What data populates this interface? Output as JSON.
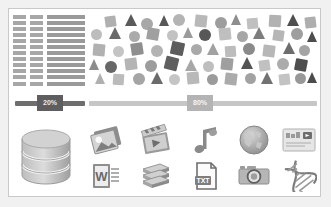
{
  "card": {
    "background": "#ffffff",
    "border_color": "#c9c9c9",
    "page_background": "#f1f1f1"
  },
  "list_block": {
    "name": "data-table-placeholder",
    "row_count": 12,
    "bar_color": "#9a9a9a",
    "cell_color": "#a7a7a7"
  },
  "shapes": {
    "name": "shape-scatter-cloud",
    "palette": [
      "#b9b9b9",
      "#a3a3a3",
      "#8c8c8c",
      "#6f6f6f",
      "#565656",
      "#cccccc"
    ],
    "items": [
      {
        "type": "square",
        "x": 18,
        "y": 5,
        "size": 11,
        "color": "#b0b0b0",
        "rot": -8
      },
      {
        "type": "triangle",
        "x": 38,
        "y": 3,
        "size": 12,
        "color": "#5a5a5a",
        "rot": 0
      },
      {
        "type": "circle",
        "x": 54,
        "y": 7,
        "size": 12,
        "color": "#a8a8a8"
      },
      {
        "type": "triangle",
        "x": 72,
        "y": 4,
        "size": 11,
        "color": "#585858",
        "rot": 0
      },
      {
        "type": "circle",
        "x": 86,
        "y": 3,
        "size": 12,
        "color": "#b4b4b4"
      },
      {
        "type": "square",
        "x": 108,
        "y": 4,
        "size": 12,
        "color": "#b8b8b8",
        "rot": 6
      },
      {
        "type": "circle",
        "x": 128,
        "y": 6,
        "size": 12,
        "color": "#9d9d9d"
      },
      {
        "type": "triangle",
        "x": 144,
        "y": 3,
        "size": 11,
        "color": "#8e8e8e",
        "rot": 0
      },
      {
        "type": "square",
        "x": 160,
        "y": 7,
        "size": 11,
        "color": "#c0c0c0",
        "rot": -5
      },
      {
        "type": "square",
        "x": 182,
        "y": 4,
        "size": 12,
        "color": "#b2b2b2",
        "rot": 4
      },
      {
        "type": "triangle",
        "x": 200,
        "y": 3,
        "size": 12,
        "color": "#4f4f4f",
        "rot": 0
      },
      {
        "type": "square",
        "x": 218,
        "y": 6,
        "size": 11,
        "color": "#aeaeae",
        "rot": -7
      },
      {
        "type": "circle",
        "x": 4,
        "y": 18,
        "size": 11,
        "color": "#bdbdbd"
      },
      {
        "type": "triangle",
        "x": 22,
        "y": 16,
        "size": 12,
        "color": "#6a6a6a",
        "rot": 0
      },
      {
        "type": "circle",
        "x": 42,
        "y": 20,
        "size": 11,
        "color": "#aaaaaa"
      },
      {
        "type": "square",
        "x": 60,
        "y": 17,
        "size": 12,
        "color": "#a0a0a0",
        "rot": 10
      },
      {
        "type": "circle",
        "x": 80,
        "y": 19,
        "size": 11,
        "color": "#c2c2c2"
      },
      {
        "type": "triangle",
        "x": 96,
        "y": 16,
        "size": 11,
        "color": "#9b9b9b",
        "rot": 0
      },
      {
        "type": "circle",
        "x": 112,
        "y": 18,
        "size": 12,
        "color": "#575757"
      },
      {
        "type": "square",
        "x": 132,
        "y": 17,
        "size": 12,
        "color": "#bfbfbf",
        "rot": -6
      },
      {
        "type": "circle",
        "x": 150,
        "y": 20,
        "size": 11,
        "color": "#a6a6a6"
      },
      {
        "type": "triangle",
        "x": 166,
        "y": 16,
        "size": 12,
        "color": "#7d7d7d",
        "rot": 0
      },
      {
        "type": "square",
        "x": 186,
        "y": 19,
        "size": 11,
        "color": "#b6b6b6",
        "rot": 8
      },
      {
        "type": "circle",
        "x": 204,
        "y": 17,
        "size": 12,
        "color": "#9e9e9e"
      },
      {
        "type": "triangle",
        "x": 220,
        "y": 20,
        "size": 11,
        "color": "#4d4d4d",
        "rot": 0
      },
      {
        "type": "square",
        "x": 6,
        "y": 33,
        "size": 12,
        "color": "#b1b1b1",
        "rot": 5
      },
      {
        "type": "circle",
        "x": 26,
        "y": 35,
        "size": 11,
        "color": "#c4c4c4"
      },
      {
        "type": "square",
        "x": 44,
        "y": 32,
        "size": 12,
        "color": "#8f8f8f",
        "rot": -9
      },
      {
        "type": "circle",
        "x": 64,
        "y": 34,
        "size": 12,
        "color": "#b3b3b3"
      },
      {
        "type": "square",
        "x": 84,
        "y": 31,
        "size": 13,
        "color": "#5c5c5c",
        "rot": 12
      },
      {
        "type": "circle",
        "x": 104,
        "y": 33,
        "size": 11,
        "color": "#a9a9a9"
      },
      {
        "type": "triangle",
        "x": 120,
        "y": 32,
        "size": 12,
        "color": "#a1a1a1",
        "rot": 0
      },
      {
        "type": "square",
        "x": 138,
        "y": 35,
        "size": 11,
        "color": "#bcbcbc",
        "rot": -4
      },
      {
        "type": "circle",
        "x": 156,
        "y": 32,
        "size": 12,
        "color": "#8a8a8a"
      },
      {
        "type": "square",
        "x": 176,
        "y": 34,
        "size": 12,
        "color": "#b7b7b7",
        "rot": 7
      },
      {
        "type": "triangle",
        "x": 196,
        "y": 31,
        "size": 12,
        "color": "#6d6d6d",
        "rot": 0
      },
      {
        "type": "circle",
        "x": 212,
        "y": 34,
        "size": 11,
        "color": "#a4a4a4"
      },
      {
        "type": "triangle",
        "x": 2,
        "y": 48,
        "size": 11,
        "color": "#8d8d8d",
        "rot": 0
      },
      {
        "type": "circle",
        "x": 18,
        "y": 50,
        "size": 12,
        "color": "#676767"
      },
      {
        "type": "square",
        "x": 38,
        "y": 47,
        "size": 12,
        "color": "#b5b5b5",
        "rot": -7
      },
      {
        "type": "circle",
        "x": 58,
        "y": 49,
        "size": 12,
        "color": "#9c9c9c"
      },
      {
        "type": "square",
        "x": 78,
        "y": 46,
        "size": 13,
        "color": "#5f5f5f",
        "rot": 14
      },
      {
        "type": "triangle",
        "x": 98,
        "y": 48,
        "size": 12,
        "color": "#a7a7a7",
        "rot": 0
      },
      {
        "type": "circle",
        "x": 116,
        "y": 50,
        "size": 11,
        "color": "#bebebe"
      },
      {
        "type": "square",
        "x": 134,
        "y": 47,
        "size": 12,
        "color": "#9f9f9f",
        "rot": 6
      },
      {
        "type": "triangle",
        "x": 154,
        "y": 46,
        "size": 12,
        "color": "#545454",
        "rot": 0
      },
      {
        "type": "square",
        "x": 172,
        "y": 49,
        "size": 11,
        "color": "#c1c1c1",
        "rot": -8
      },
      {
        "type": "circle",
        "x": 190,
        "y": 47,
        "size": 12,
        "color": "#acacac"
      },
      {
        "type": "square",
        "x": 208,
        "y": 48,
        "size": 12,
        "color": "#4e4e4e",
        "rot": 11
      },
      {
        "type": "triangle",
        "x": 8,
        "y": 62,
        "size": 11,
        "color": "#b0b0b0",
        "rot": 0
      },
      {
        "type": "square",
        "x": 26,
        "y": 63,
        "size": 11,
        "color": "#bbbbbb",
        "rot": 4
      },
      {
        "type": "circle",
        "x": 46,
        "y": 62,
        "size": 12,
        "color": "#a5a5a5"
      },
      {
        "type": "triangle",
        "x": 64,
        "y": 61,
        "size": 12,
        "color": "#6b6b6b",
        "rot": 0
      },
      {
        "type": "circle",
        "x": 82,
        "y": 63,
        "size": 11,
        "color": "#c5c5c5"
      },
      {
        "type": "square",
        "x": 100,
        "y": 61,
        "size": 12,
        "color": "#b9b9b9",
        "rot": -5
      },
      {
        "type": "circle",
        "x": 120,
        "y": 63,
        "size": 11,
        "color": "#9b9b9b"
      },
      {
        "type": "square",
        "x": 138,
        "y": 62,
        "size": 12,
        "color": "#ababab",
        "rot": 7
      },
      {
        "type": "circle",
        "x": 158,
        "y": 62,
        "size": 11,
        "color": "#a2a2a2"
      },
      {
        "type": "triangle",
        "x": 174,
        "y": 61,
        "size": 12,
        "color": "#727272",
        "rot": 0
      },
      {
        "type": "square",
        "x": 192,
        "y": 63,
        "size": 11,
        "color": "#c3c3c3",
        "rot": -6
      },
      {
        "type": "circle",
        "x": 208,
        "y": 62,
        "size": 11,
        "color": "#989898"
      },
      {
        "type": "triangle",
        "x": 220,
        "y": 61,
        "size": 11,
        "color": "#4c4c4c",
        "rot": 0
      }
    ]
  },
  "sliders": [
    {
      "name": "progress-slider-20",
      "label": "20%",
      "value": 20,
      "track_color": "#6e6e6e",
      "badge_color": "#5e5e5e",
      "text_color": "#e9e9e9"
    },
    {
      "name": "progress-slider-80",
      "label": "80%",
      "value": 80,
      "track_color": "#c6c6c6",
      "badge_color": "#b4b4b4",
      "text_color": "#f4f4f4"
    }
  ],
  "icons": [
    {
      "name": "database-icon",
      "label": "Database"
    },
    {
      "name": "photos-icon",
      "label": "Photos"
    },
    {
      "name": "word-document-icon",
      "label": "Word Document"
    },
    {
      "name": "video-clapperboard-icon",
      "label": "Video"
    },
    {
      "name": "books-stack-icon",
      "label": "Books"
    },
    {
      "name": "music-note-icon",
      "label": "Music"
    },
    {
      "name": "txt-file-icon",
      "label": "TXT File"
    },
    {
      "name": "globe-icon",
      "label": "Globe"
    },
    {
      "name": "camera-icon",
      "label": "Camera"
    },
    {
      "name": "media-card-icon",
      "label": "Media Card"
    },
    {
      "name": "dna-helix-icon",
      "label": "DNA"
    }
  ]
}
